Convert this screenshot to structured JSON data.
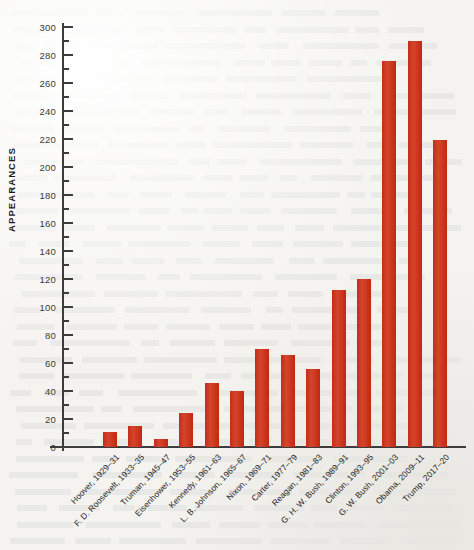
{
  "figure": {
    "background_color": "#f4f3ef",
    "bar_color": "#c8301a",
    "axis_color": "#3c3c3c",
    "note": ""
  },
  "chart_data": {
    "type": "bar",
    "title": "",
    "xlabel": "",
    "ylabel": "APPEARANCES",
    "ylim": [
      0,
      300
    ],
    "y_major_step": 20,
    "y_minor_step": 10,
    "grid": false,
    "legend": null,
    "y_ticks": [
      0,
      20,
      40,
      60,
      80,
      100,
      120,
      140,
      160,
      180,
      200,
      220,
      240,
      260,
      280,
      300
    ],
    "categories": [
      "Hoover, 1929–31",
      "F. D. Roosevelt, 1933–35",
      "Truman, 1945–47",
      "Eisenhower, 1953–55",
      "Kennedy, 1961–63",
      "L. B. Johnson, 1965–67",
      "Nixon, 1969–71",
      "Carter, 1977–79",
      "Reagan, 1981–83",
      "G. H. W. Bush, 1989–91",
      "Clinton, 1993–95",
      "G. W. Bush, 2001–03",
      "Obama, 2009–11",
      "Trump, 2017–20"
    ],
    "values": [
      11,
      15,
      6,
      24,
      46,
      40,
      70,
      66,
      56,
      112,
      120,
      276,
      290,
      219
    ]
  }
}
